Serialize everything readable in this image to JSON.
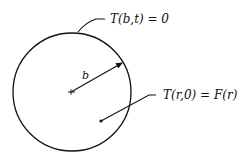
{
  "diagram": {
    "title": "",
    "boundary_condition": "T(b,t) = 0",
    "initial_condition": "T(r,0) = F(r)",
    "radius_label": "b",
    "ink_color": "#111111",
    "background_color": "#ffffff"
  }
}
